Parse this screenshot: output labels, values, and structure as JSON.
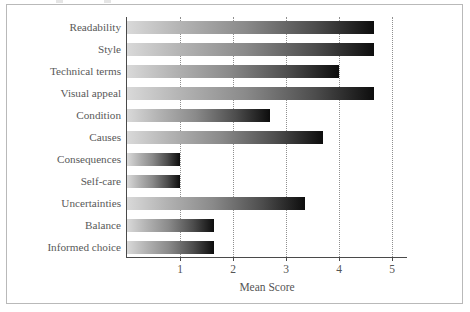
{
  "chart_data": {
    "type": "bar",
    "orientation": "horizontal",
    "title": "",
    "xlabel": "Mean Score",
    "ylabel": "",
    "xlim": [
      0.0,
      5.3
    ],
    "xticks": [
      1,
      2,
      3,
      4,
      5
    ],
    "xticklabels": [
      "1",
      "2",
      "3",
      "4",
      "5"
    ],
    "grid": "vertical dotted gridlines at each x tick",
    "legend": "none",
    "bar_fill": "horizontal gradient, light grey at left to black at right",
    "categories": [
      "Readability",
      "Style",
      "Technical terms",
      "Visual appeal",
      "Condition",
      "Causes",
      "Consequences",
      "Self-care",
      "Uncertainties",
      "Balance",
      "Informed choice"
    ],
    "values": [
      4.65,
      4.65,
      4.0,
      4.65,
      2.7,
      3.7,
      1.0,
      1.0,
      3.35,
      1.65,
      1.65
    ],
    "series": [
      {
        "name": "Mean Score",
        "values": [
          4.65,
          4.65,
          4.0,
          4.65,
          2.7,
          3.7,
          1.0,
          1.0,
          3.35,
          1.65,
          1.65
        ]
      }
    ]
  },
  "colors": {
    "bar_gradient_start": "#d9d9d9",
    "bar_gradient_end": "#0d0d0d",
    "axis_line": "#4a4a4a",
    "gridline": "#8f8f8f",
    "tick_label": "#555555",
    "category_label": "#595959",
    "frame_border": "#b9b9b9",
    "background": "#ffffff"
  }
}
